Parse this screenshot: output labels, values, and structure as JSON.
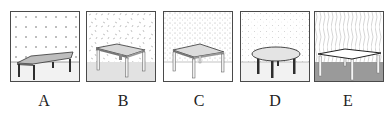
{
  "figure": {
    "options": [
      {
        "id": "A",
        "label": "A",
        "wall_pattern": "crosses",
        "floor": "light",
        "table": "rectangular, dark legs",
        "x": 10
      },
      {
        "id": "B",
        "label": "B",
        "wall_pattern": "dashes",
        "floor": "light gray",
        "table": "square, light legs",
        "x": 86
      },
      {
        "id": "C",
        "label": "C",
        "wall_pattern": "dense dots",
        "floor": "white",
        "table": "square, light legs",
        "x": 163
      },
      {
        "id": "D",
        "label": "D",
        "wall_pattern": "dots",
        "floor": "light",
        "table": "round, dark legs",
        "x": 240
      },
      {
        "id": "E",
        "label": "E",
        "wall_pattern": "wavy lines",
        "floor": "dark gray",
        "table": "square, white top",
        "x": 314
      }
    ]
  },
  "colors": {
    "border": "#4a4a4a",
    "floor_light": "#f0f0f0",
    "floor_gray": "#e2e2e2",
    "floor_dark": "#9a9a9a",
    "table_top": "#d8d8d8",
    "leg_dark": "#2e2e2e",
    "leg_light": "#e8e8e8"
  }
}
